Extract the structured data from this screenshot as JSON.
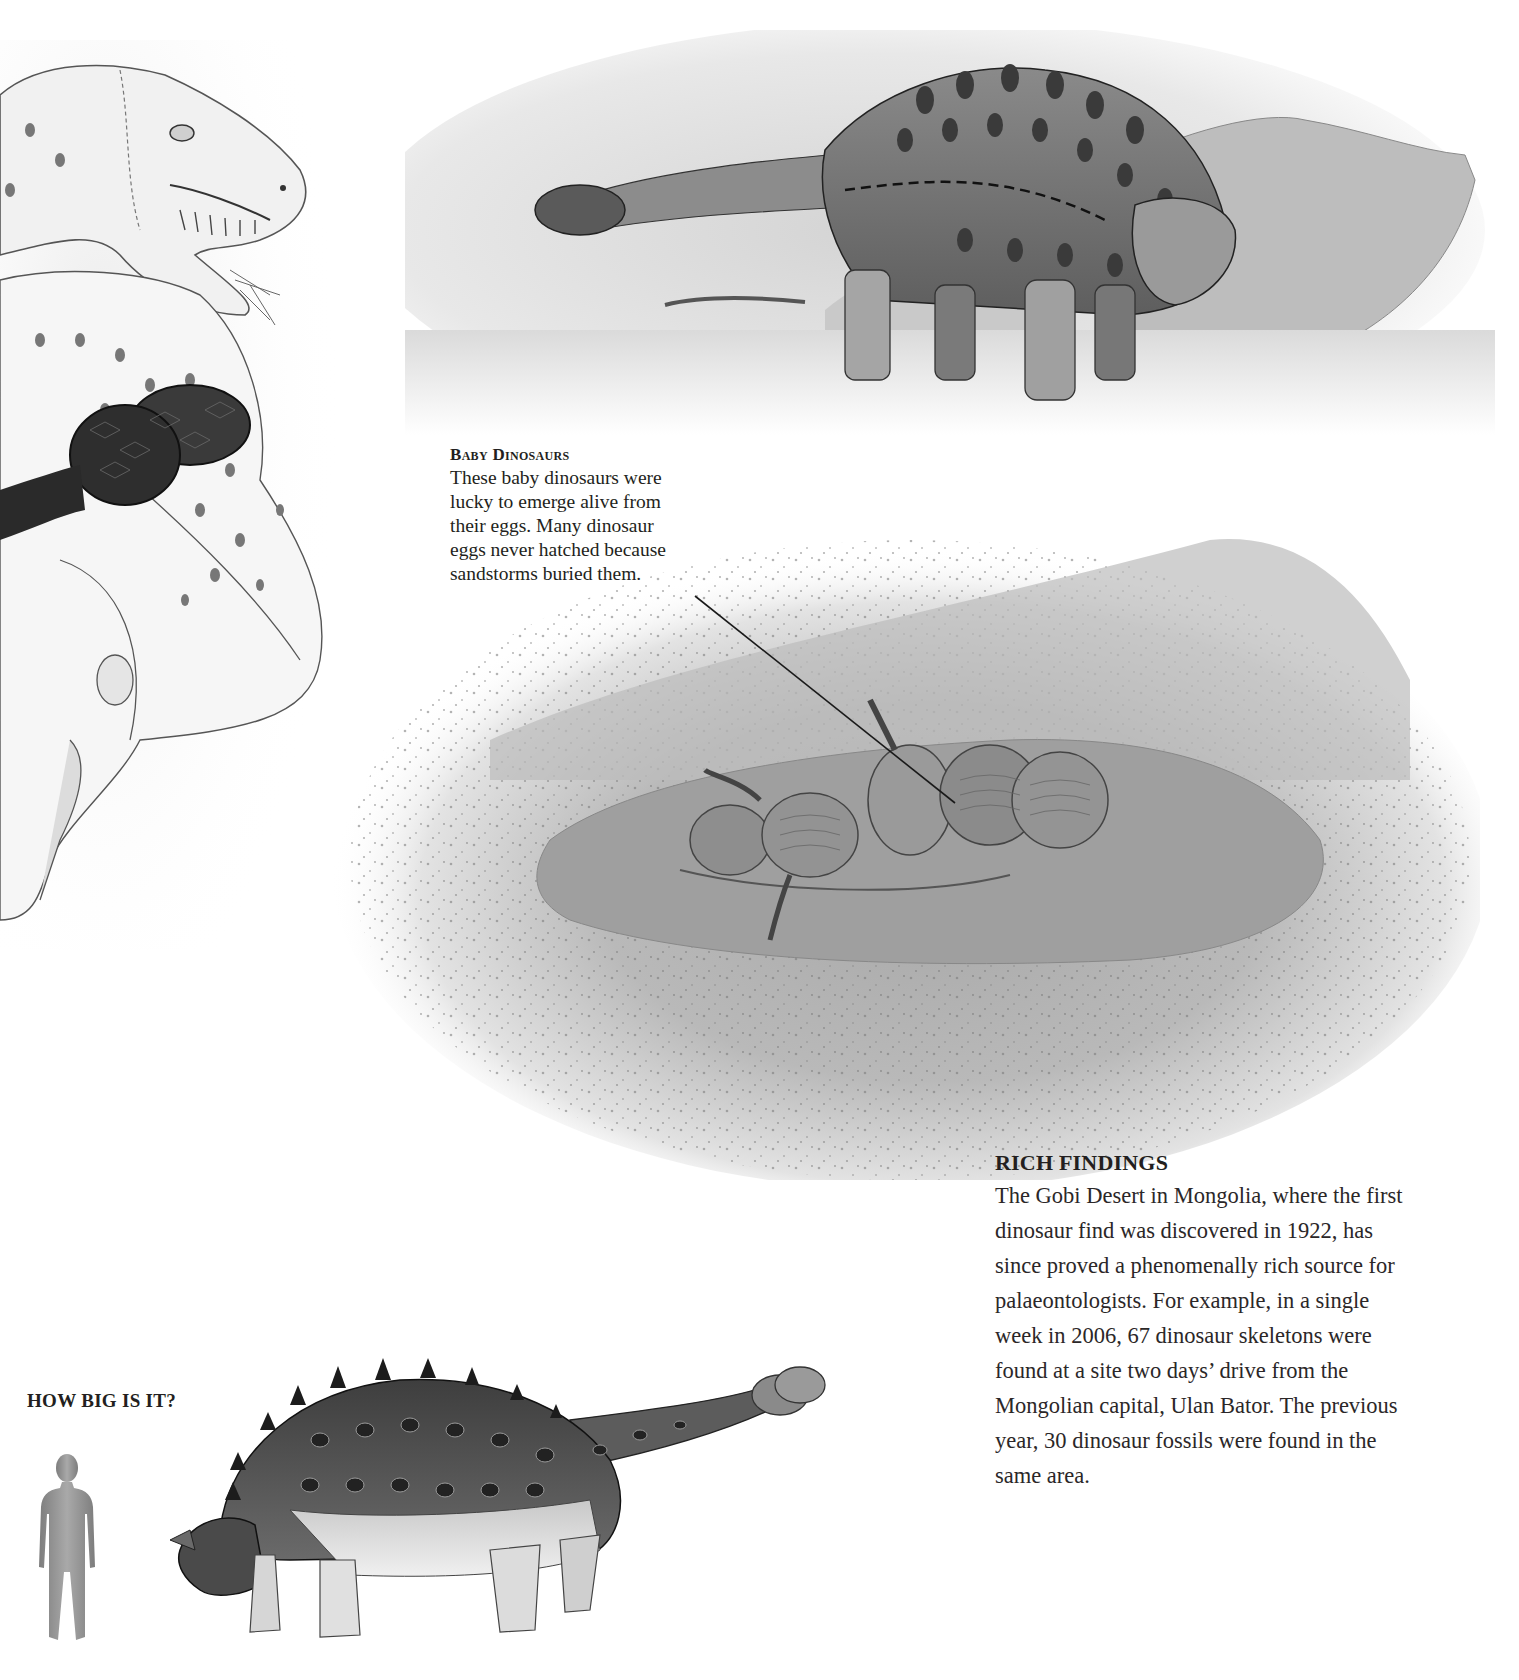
{
  "page": {
    "background": "#ffffff",
    "text_color": "#231f20"
  },
  "illustrations": {
    "trex_sketch": {
      "label": "Tyrannosaur pencil sketch (left edge)"
    },
    "ankylosaur_scene": {
      "label": "Ankylosaur in desert landscape"
    },
    "nest_scene": {
      "label": "Baby dinosaurs hatching in a sand nest"
    },
    "size_comparison": {
      "label": "Ankylosaur side view beside human silhouette"
    }
  },
  "baby_dinosaurs": {
    "title": "Baby Dinosaurs",
    "lines": [
      "These baby dinosaurs were",
      "lucky to emerge alive from",
      "their eggs. Many dinosaur",
      "eggs never hatched because",
      "sandstorms buried them."
    ]
  },
  "rich_findings": {
    "title": "RICH FINDINGS",
    "lines": [
      "The Gobi Desert in Mongolia, where the first",
      "dinosaur find was discovered in 1922, has",
      "since proved a phenomenally rich source for",
      "palaeontologists. For example, in a single",
      "week in 2006, 67 dinosaur skeletons were",
      "found at a site two days’ drive from the",
      "Mongolian capital, Ulan Bator. The previous",
      "year, 30 dinosaur fossils were found in the",
      "same area."
    ]
  },
  "size_comparison": {
    "title": "HOW BIG IS IT?"
  }
}
